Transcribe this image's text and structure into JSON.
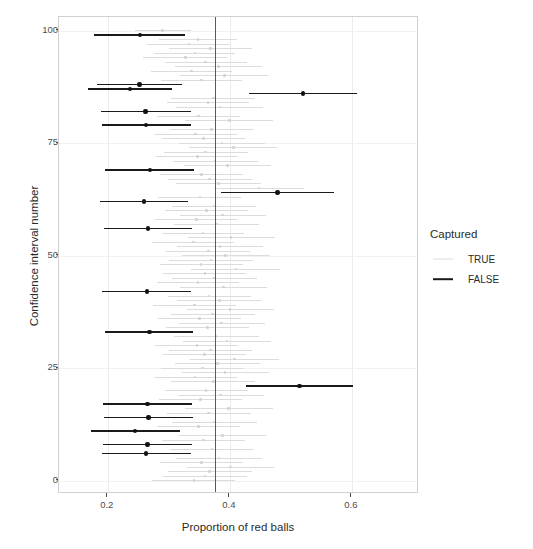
{
  "chart_data": {
    "type": "scatter",
    "title": "",
    "xlabel": "Proportion of red balls",
    "ylabel": "Confidence interval number",
    "xlim": [
      0.12,
      0.71
    ],
    "ylim": [
      -3,
      103
    ],
    "xticks": [
      0.2,
      0.4,
      0.6
    ],
    "xticklabels": [
      "0.2",
      "0.4",
      "0.6"
    ],
    "yticks": [
      0,
      25,
      50,
      75,
      100
    ],
    "yticklabels": [
      "0",
      "25",
      "50",
      "75",
      "100"
    ],
    "grid": true,
    "legend_position": "right",
    "reference_line": {
      "x": 0.375,
      "color": "#5a5a5a",
      "label": ""
    },
    "colors": {
      "captured_true": "#dcdcdc",
      "captured_false": "#1a1a1a",
      "panel_border": "#d0d0d0",
      "gridline": "#ececec"
    },
    "legend": {
      "title": "Captured",
      "entries": [
        {
          "label": "TRUE",
          "color": "#dcdcdc"
        },
        {
          "label": "FALSE",
          "color": "#1a1a1a"
        }
      ]
    },
    "series": [
      {
        "name": "Confidence intervals",
        "note": "Each row is one 95% CI: n = interval number, lo/hi = interval bounds, p = sample proportion, captured = whether the CI contains 0.375",
        "points": [
          {
            "n": 100,
            "lo": 0.244,
            "hi": 0.336,
            "p": 0.29,
            "captured": true
          },
          {
            "n": 99,
            "lo": 0.178,
            "hi": 0.327,
            "p": 0.253,
            "captured": false
          },
          {
            "n": 98,
            "lo": 0.284,
            "hi": 0.412,
            "p": 0.348,
            "captured": true
          },
          {
            "n": 97,
            "lo": 0.265,
            "hi": 0.401,
            "p": 0.333,
            "captured": true
          },
          {
            "n": 96,
            "lo": 0.3,
            "hi": 0.437,
            "p": 0.368,
            "captured": true
          },
          {
            "n": 95,
            "lo": 0.276,
            "hi": 0.409,
            "p": 0.343,
            "captured": true
          },
          {
            "n": 94,
            "lo": 0.258,
            "hi": 0.395,
            "p": 0.327,
            "captured": true
          },
          {
            "n": 93,
            "lo": 0.293,
            "hi": 0.428,
            "p": 0.36,
            "captured": true
          },
          {
            "n": 92,
            "lo": 0.31,
            "hi": 0.452,
            "p": 0.381,
            "captured": true
          },
          {
            "n": 91,
            "lo": 0.27,
            "hi": 0.404,
            "p": 0.337,
            "captured": true
          },
          {
            "n": 90,
            "lo": 0.318,
            "hi": 0.463,
            "p": 0.391,
            "captured": true
          },
          {
            "n": 89,
            "lo": 0.287,
            "hi": 0.42,
            "p": 0.354,
            "captured": true
          },
          {
            "n": 88,
            "lo": 0.182,
            "hi": 0.322,
            "p": 0.252,
            "captured": false
          },
          {
            "n": 87,
            "lo": 0.168,
            "hi": 0.305,
            "p": 0.236,
            "captured": false
          },
          {
            "n": 86,
            "lo": 0.432,
            "hi": 0.608,
            "p": 0.52,
            "captured": false
          },
          {
            "n": 85,
            "lo": 0.304,
            "hi": 0.442,
            "p": 0.373,
            "captured": true
          },
          {
            "n": 84,
            "lo": 0.297,
            "hi": 0.431,
            "p": 0.364,
            "captured": true
          },
          {
            "n": 83,
            "lo": 0.312,
            "hi": 0.455,
            "p": 0.384,
            "captured": true
          },
          {
            "n": 82,
            "lo": 0.189,
            "hi": 0.336,
            "p": 0.262,
            "captured": false
          },
          {
            "n": 81,
            "lo": 0.281,
            "hi": 0.417,
            "p": 0.349,
            "captured": true
          },
          {
            "n": 80,
            "lo": 0.327,
            "hi": 0.47,
            "p": 0.399,
            "captured": true
          },
          {
            "n": 79,
            "lo": 0.19,
            "hi": 0.336,
            "p": 0.263,
            "captured": false
          },
          {
            "n": 78,
            "lo": 0.302,
            "hi": 0.439,
            "p": 0.37,
            "captured": true
          },
          {
            "n": 77,
            "lo": 0.275,
            "hi": 0.412,
            "p": 0.344,
            "captured": true
          },
          {
            "n": 76,
            "lo": 0.289,
            "hi": 0.425,
            "p": 0.357,
            "captured": true
          },
          {
            "n": 75,
            "lo": 0.316,
            "hi": 0.458,
            "p": 0.387,
            "captured": true
          },
          {
            "n": 74,
            "lo": 0.333,
            "hi": 0.478,
            "p": 0.406,
            "captured": true
          },
          {
            "n": 73,
            "lo": 0.292,
            "hi": 0.429,
            "p": 0.36,
            "captured": true
          },
          {
            "n": 72,
            "lo": 0.279,
            "hi": 0.414,
            "p": 0.347,
            "captured": true
          },
          {
            "n": 71,
            "lo": 0.307,
            "hi": 0.446,
            "p": 0.376,
            "captured": true
          },
          {
            "n": 70,
            "lo": 0.325,
            "hi": 0.468,
            "p": 0.396,
            "captured": true
          },
          {
            "n": 69,
            "lo": 0.196,
            "hi": 0.341,
            "p": 0.269,
            "captured": false
          },
          {
            "n": 68,
            "lo": 0.286,
            "hi": 0.422,
            "p": 0.354,
            "captured": true
          },
          {
            "n": 67,
            "lo": 0.299,
            "hi": 0.436,
            "p": 0.367,
            "captured": true
          },
          {
            "n": 66,
            "lo": 0.311,
            "hi": 0.451,
            "p": 0.381,
            "captured": true
          },
          {
            "n": 65,
            "lo": 0.374,
            "hi": 0.522,
            "p": 0.448,
            "captured": true
          },
          {
            "n": 64,
            "lo": 0.386,
            "hi": 0.57,
            "p": 0.478,
            "captured": false
          },
          {
            "n": 63,
            "lo": 0.283,
            "hi": 0.419,
            "p": 0.351,
            "captured": true
          },
          {
            "n": 62,
            "lo": 0.187,
            "hi": 0.331,
            "p": 0.259,
            "captured": false
          },
          {
            "n": 61,
            "lo": 0.305,
            "hi": 0.443,
            "p": 0.374,
            "captured": true
          },
          {
            "n": 60,
            "lo": 0.294,
            "hi": 0.43,
            "p": 0.362,
            "captured": true
          },
          {
            "n": 59,
            "lo": 0.318,
            "hi": 0.459,
            "p": 0.388,
            "captured": true
          },
          {
            "n": 58,
            "lo": 0.277,
            "hi": 0.413,
            "p": 0.345,
            "captured": true
          },
          {
            "n": 57,
            "lo": 0.309,
            "hi": 0.448,
            "p": 0.378,
            "captured": true
          },
          {
            "n": 56,
            "lo": 0.193,
            "hi": 0.338,
            "p": 0.266,
            "captured": false
          },
          {
            "n": 55,
            "lo": 0.288,
            "hi": 0.424,
            "p": 0.356,
            "captured": true
          },
          {
            "n": 54,
            "lo": 0.331,
            "hi": 0.474,
            "p": 0.402,
            "captured": true
          },
          {
            "n": 53,
            "lo": 0.272,
            "hi": 0.407,
            "p": 0.34,
            "captured": true
          },
          {
            "n": 52,
            "lo": 0.314,
            "hi": 0.454,
            "p": 0.384,
            "captured": true
          },
          {
            "n": 51,
            "lo": 0.296,
            "hi": 0.433,
            "p": 0.365,
            "captured": true
          },
          {
            "n": 50,
            "lo": 0.322,
            "hi": 0.465,
            "p": 0.393,
            "captured": true
          },
          {
            "n": 49,
            "lo": 0.301,
            "hi": 0.438,
            "p": 0.369,
            "captured": true
          },
          {
            "n": 48,
            "lo": 0.285,
            "hi": 0.421,
            "p": 0.353,
            "captured": true
          },
          {
            "n": 47,
            "lo": 0.337,
            "hi": 0.482,
            "p": 0.41,
            "captured": true
          },
          {
            "n": 46,
            "lo": 0.291,
            "hi": 0.427,
            "p": 0.359,
            "captured": true
          },
          {
            "n": 45,
            "lo": 0.306,
            "hi": 0.445,
            "p": 0.375,
            "captured": true
          },
          {
            "n": 44,
            "lo": 0.28,
            "hi": 0.415,
            "p": 0.348,
            "captured": true
          },
          {
            "n": 43,
            "lo": 0.319,
            "hi": 0.461,
            "p": 0.39,
            "captured": true
          },
          {
            "n": 42,
            "lo": 0.191,
            "hi": 0.337,
            "p": 0.264,
            "captured": false
          },
          {
            "n": 41,
            "lo": 0.298,
            "hi": 0.435,
            "p": 0.366,
            "captured": true
          },
          {
            "n": 40,
            "lo": 0.313,
            "hi": 0.453,
            "p": 0.383,
            "captured": true
          },
          {
            "n": 39,
            "lo": 0.274,
            "hi": 0.41,
            "p": 0.342,
            "captured": true
          },
          {
            "n": 38,
            "lo": 0.329,
            "hi": 0.472,
            "p": 0.4,
            "captured": true
          },
          {
            "n": 37,
            "lo": 0.303,
            "hi": 0.441,
            "p": 0.372,
            "captured": true
          },
          {
            "n": 36,
            "lo": 0.282,
            "hi": 0.418,
            "p": 0.35,
            "captured": true
          },
          {
            "n": 35,
            "lo": 0.316,
            "hi": 0.457,
            "p": 0.386,
            "captured": true
          },
          {
            "n": 34,
            "lo": 0.295,
            "hi": 0.432,
            "p": 0.363,
            "captured": true
          },
          {
            "n": 33,
            "lo": 0.195,
            "hi": 0.34,
            "p": 0.268,
            "captured": false
          },
          {
            "n": 32,
            "lo": 0.308,
            "hi": 0.447,
            "p": 0.377,
            "captured": true
          },
          {
            "n": 31,
            "lo": 0.324,
            "hi": 0.467,
            "p": 0.395,
            "captured": true
          },
          {
            "n": 30,
            "lo": 0.278,
            "hi": 0.414,
            "p": 0.346,
            "captured": true
          },
          {
            "n": 29,
            "lo": 0.3,
            "hi": 0.437,
            "p": 0.368,
            "captured": true
          },
          {
            "n": 28,
            "lo": 0.29,
            "hi": 0.426,
            "p": 0.358,
            "captured": true
          },
          {
            "n": 27,
            "lo": 0.335,
            "hi": 0.48,
            "p": 0.408,
            "captured": true
          },
          {
            "n": 26,
            "lo": 0.31,
            "hi": 0.45,
            "p": 0.38,
            "captured": true
          },
          {
            "n": 25,
            "lo": 0.287,
            "hi": 0.423,
            "p": 0.355,
            "captured": true
          },
          {
            "n": 24,
            "lo": 0.321,
            "hi": 0.464,
            "p": 0.392,
            "captured": true
          },
          {
            "n": 23,
            "lo": 0.276,
            "hi": 0.411,
            "p": 0.343,
            "captured": true
          },
          {
            "n": 22,
            "lo": 0.304,
            "hi": 0.442,
            "p": 0.373,
            "captured": true
          },
          {
            "n": 21,
            "lo": 0.427,
            "hi": 0.602,
            "p": 0.514,
            "captured": false
          },
          {
            "n": 20,
            "lo": 0.293,
            "hi": 0.43,
            "p": 0.361,
            "captured": true
          },
          {
            "n": 19,
            "lo": 0.315,
            "hi": 0.456,
            "p": 0.385,
            "captured": true
          },
          {
            "n": 18,
            "lo": 0.284,
            "hi": 0.42,
            "p": 0.352,
            "captured": true
          },
          {
            "n": 17,
            "lo": 0.192,
            "hi": 0.338,
            "p": 0.265,
            "captured": false
          },
          {
            "n": 16,
            "lo": 0.327,
            "hi": 0.47,
            "p": 0.398,
            "captured": true
          },
          {
            "n": 15,
            "lo": 0.297,
            "hi": 0.434,
            "p": 0.365,
            "captured": true
          },
          {
            "n": 14,
            "lo": 0.194,
            "hi": 0.339,
            "p": 0.267,
            "captured": false
          },
          {
            "n": 13,
            "lo": 0.306,
            "hi": 0.444,
            "p": 0.374,
            "captured": true
          },
          {
            "n": 12,
            "lo": 0.281,
            "hi": 0.417,
            "p": 0.349,
            "captured": true
          },
          {
            "n": 11,
            "lo": 0.173,
            "hi": 0.318,
            "p": 0.245,
            "captured": false
          },
          {
            "n": 10,
            "lo": 0.317,
            "hi": 0.459,
            "p": 0.388,
            "captured": true
          },
          {
            "n": 9,
            "lo": 0.288,
            "hi": 0.425,
            "p": 0.357,
            "captured": true
          },
          {
            "n": 8,
            "lo": 0.192,
            "hi": 0.338,
            "p": 0.265,
            "captured": false
          },
          {
            "n": 7,
            "lo": 0.302,
            "hi": 0.44,
            "p": 0.371,
            "captured": true
          },
          {
            "n": 6,
            "lo": 0.19,
            "hi": 0.336,
            "p": 0.263,
            "captured": false
          },
          {
            "n": 5,
            "lo": 0.312,
            "hi": 0.452,
            "p": 0.382,
            "captured": true
          },
          {
            "n": 4,
            "lo": 0.286,
            "hi": 0.422,
            "p": 0.354,
            "captured": true
          },
          {
            "n": 3,
            "lo": 0.33,
            "hi": 0.473,
            "p": 0.401,
            "captured": true
          },
          {
            "n": 2,
            "lo": 0.299,
            "hi": 0.436,
            "p": 0.367,
            "captured": true
          },
          {
            "n": 1,
            "lo": 0.291,
            "hi": 0.428,
            "p": 0.359,
            "captured": true
          },
          {
            "n": 0,
            "lo": 0.273,
            "hi": 0.409,
            "p": 0.341,
            "captured": true
          }
        ]
      }
    ]
  }
}
